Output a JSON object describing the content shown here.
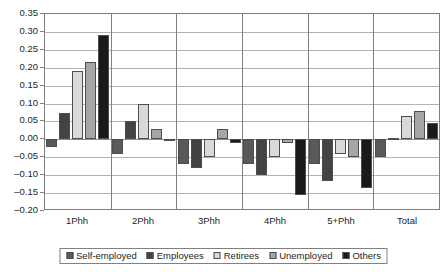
{
  "chart_data": {
    "type": "bar",
    "title": "",
    "subtitle": "",
    "xlabel": "",
    "ylabel": "",
    "categories": [
      "1Phh",
      "2Phh",
      "3Phh",
      "4Phh",
      "5+Phh",
      "Total"
    ],
    "series": [
      {
        "name": "Self-employed",
        "color": "#595959",
        "values": [
          -0.02,
          -0.04,
          -0.07,
          -0.07,
          -0.07,
          -0.05
        ]
      },
      {
        "name": "Employees",
        "color": "#434343",
        "values": [
          0.075,
          0.05,
          -0.08,
          -0.1,
          -0.115,
          0.005
        ]
      },
      {
        "name": "Retirees",
        "color": "#d9d9d9",
        "values": [
          0.19,
          0.1,
          -0.05,
          -0.05,
          -0.04,
          0.065
        ]
      },
      {
        "name": "Unemployed",
        "color": "#a6a6a6",
        "values": [
          0.215,
          0.03,
          0.03,
          -0.01,
          -0.05,
          0.08
        ]
      },
      {
        "name": "Others",
        "color": "#1a1a1a",
        "values": [
          0.29,
          -0.005,
          -0.01,
          -0.155,
          -0.135,
          0.045
        ]
      }
    ],
    "ylim": [
      -0.2,
      0.35
    ],
    "ytick_step": 0.05,
    "yticks": [
      "0.35",
      "0.30",
      "0.25",
      "0.20",
      "0.15",
      "0.10",
      "0.05",
      "0.00",
      "-0.05",
      "-0.10",
      "-0.15",
      "-0.20"
    ],
    "grid": true,
    "legend_position": "bottom"
  },
  "legend": {
    "items": [
      {
        "label": "Self-employed",
        "color": "#595959"
      },
      {
        "label": "Employees",
        "color": "#434343"
      },
      {
        "label": "Retirees",
        "color": "#d9d9d9"
      },
      {
        "label": "Unemployed",
        "color": "#a6a6a6"
      },
      {
        "label": "Others",
        "color": "#1a1a1a"
      }
    ]
  }
}
